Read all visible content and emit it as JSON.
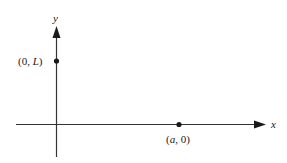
{
  "diagram": {
    "type": "coordinate-axes",
    "axes": {
      "x_label": "x",
      "y_label": "y"
    },
    "points": [
      {
        "label_open": "(0, ",
        "label_var": "L",
        "label_close": ")",
        "x": 0,
        "y": "L"
      },
      {
        "label_open": "(",
        "label_var": "a",
        "label_close": ", 0)",
        "x": "a",
        "y": 0
      }
    ],
    "colors": {
      "line": "#333333",
      "text": "#1a1a1a",
      "background": "#ffffff"
    }
  }
}
